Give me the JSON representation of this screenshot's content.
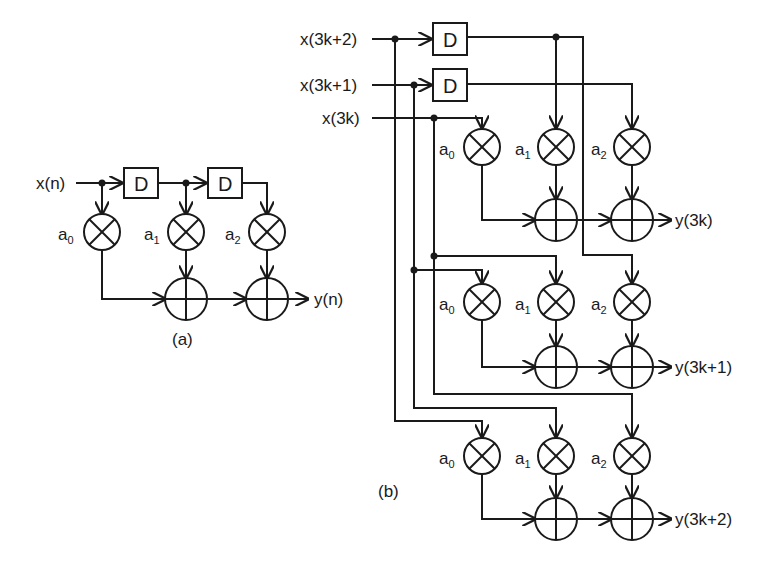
{
  "diagram_a": {
    "caption": "(a)",
    "input": "x(n)",
    "output": "y(n)",
    "delay_label": "D",
    "coefficients": [
      {
        "base": "a",
        "sub": "0"
      },
      {
        "base": "a",
        "sub": "1"
      },
      {
        "base": "a",
        "sub": "2"
      }
    ]
  },
  "diagram_b": {
    "caption": "(b)",
    "inputs": [
      "x(3k+2)",
      "x(3k+1)",
      "x(3k)"
    ],
    "outputs": [
      "y(3k)",
      "y(3k+1)",
      "y(3k+2)"
    ],
    "delay_label": "D",
    "coefficients": [
      {
        "base": "a",
        "sub": "0"
      },
      {
        "base": "a",
        "sub": "1"
      },
      {
        "base": "a",
        "sub": "2"
      }
    ]
  },
  "colors": {
    "stroke": "#1a1a1a",
    "background": "#ffffff"
  }
}
